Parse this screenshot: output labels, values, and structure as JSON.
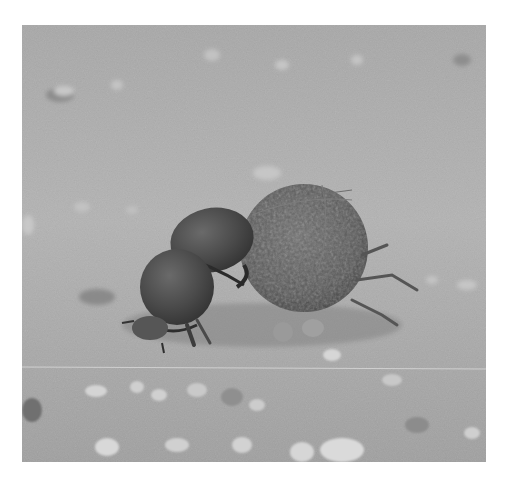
{
  "image": {
    "subject": "Two dung beetles with a dung ball on sandy ground",
    "style": "grayscale photograph",
    "frame": {
      "x": 22,
      "y": 25,
      "width": 464,
      "height": 437
    },
    "colors": {
      "page_background": "#ffffff",
      "ground_light": "#b8b8b8",
      "ground_mid": "#a2a2a2",
      "ground_dark": "#8a8a8a",
      "beetle_shell": "#4a4a4a",
      "beetle_shadow": "#2e2e2e",
      "dung_ball": "#5a5a5a",
      "pebble": "#d2d2d2"
    }
  }
}
